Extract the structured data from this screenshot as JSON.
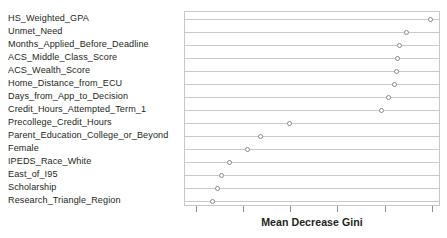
{
  "chart_data": {
    "type": "scatter",
    "title": "",
    "subtitle": "",
    "xlabel": "Mean Decrease Gini",
    "ylabel": "",
    "grid": true,
    "legend": null,
    "orientation": "horizontal",
    "marker": "open-circle",
    "axis": {
      "x_tick_count": 6,
      "x_tick_labels": [
        "",
        "",
        "",
        "",
        "",
        ""
      ],
      "x_tick_pixel_positions": [
        12,
        59,
        106,
        153,
        201,
        248
      ],
      "x_axis_labeled": false,
      "y_categories_top_to_bottom": true
    },
    "categories": [
      "HS_Weighted_GPA",
      "Unmet_Need",
      "Months_Applied_Before_Deadline",
      "ACS_Middle_Class_Score",
      "ACS_Wealth_Score",
      "Home_Distance_from_ECU",
      "Days_from_App_to_Decision",
      "Credit_Hours_Attempted_Term_1",
      "Precollege_Credit_Hours",
      "Parent_Education_College_or_Beyond",
      "Female",
      "IPEDS_Race_White",
      "East_of_I95",
      "Scholarship",
      "Research_Triangle_Region"
    ],
    "values": [
      249.0,
      225.0,
      218.0,
      216.0,
      215.0,
      213.0,
      207.0,
      200.0,
      106.0,
      77.0,
      63.0,
      45.0,
      37.0,
      33.0,
      28.0
    ],
    "xlim": [
      0,
      260
    ],
    "points": [
      {
        "category": "HS_Weighted_GPA",
        "value": 249.0,
        "px": 249.0,
        "row": 1
      },
      {
        "category": "Unmet_Need",
        "value": 225.0,
        "px": 225.0,
        "row": 2
      },
      {
        "category": "Months_Applied_Before_Deadline",
        "value": 218.0,
        "px": 218.0,
        "row": 3
      },
      {
        "category": "ACS_Middle_Class_Score",
        "value": 216.0,
        "px": 216.0,
        "row": 4
      },
      {
        "category": "ACS_Wealth_Score",
        "value": 215.0,
        "px": 215.0,
        "row": 5
      },
      {
        "category": "Home_Distance_from_ECU",
        "value": 213.0,
        "px": 213.0,
        "row": 6
      },
      {
        "category": "Days_from_App_to_Decision",
        "value": 207.0,
        "px": 207.0,
        "row": 7
      },
      {
        "category": "Credit_Hours_Attempted_Term_1",
        "value": 200.0,
        "px": 200.0,
        "row": 8
      },
      {
        "category": "Precollege_Credit_Hours",
        "value": 106.0,
        "px": 106.0,
        "row": 9
      },
      {
        "category": "Parent_Education_College_or_Beyond",
        "value": 77.0,
        "px": 77.0,
        "row": 10
      },
      {
        "category": "Female",
        "value": 63.0,
        "px": 63.0,
        "row": 11
      },
      {
        "category": "IPEDS_Race_White",
        "value": 45.0,
        "px": 45.0,
        "row": 12
      },
      {
        "category": "East_of_I95",
        "value": 37.0,
        "px": 37.0,
        "row": 13
      },
      {
        "category": "Scholarship",
        "value": 33.0,
        "px": 33.0,
        "row": 14
      },
      {
        "category": "Research_Triangle_Region",
        "value": 28.0,
        "px": 28.0,
        "row": 15
      }
    ]
  },
  "style": {
    "background": "#ffffff",
    "text_color": "#231f20",
    "gridline_color": "#c9c9c9",
    "panel_border_color": "#c8c8c8",
    "marker_stroke_color": "#8a8a8a",
    "tick_color": "#8f8f8f"
  }
}
